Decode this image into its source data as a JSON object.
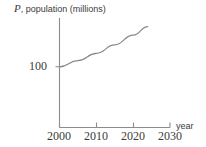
{
  "chart_data": {
    "type": "line",
    "title": "",
    "ylabel_text": "population (millions)",
    "ylabel_variable": "P",
    "ylabel_full": "P, population (millions)",
    "xlabel": "year",
    "x": [
      2000,
      2005,
      2010,
      2015,
      2020,
      2024
    ],
    "values": [
      100,
      110,
      122,
      136,
      152,
      166
    ],
    "series": [
      {
        "name": "population",
        "values": [
          100,
          110,
          122,
          136,
          152,
          166
        ]
      }
    ],
    "xticks": [
      "2000",
      "2010",
      "2020",
      "2030"
    ],
    "xtick_values": [
      2000,
      2010,
      2020,
      2030
    ],
    "yticks": [
      "100"
    ],
    "ytick_values": [
      100
    ],
    "xlim": [
      2000,
      2030
    ],
    "ylim": [
      0,
      190
    ],
    "grid": false,
    "legend": "none",
    "curve_color": "#888888",
    "axis_color": "#8c8c8c",
    "text_color": "#3a3a3a",
    "annotations": []
  },
  "axes": {
    "y_caption_variable": "P",
    "y_caption_rest": ", population (millions)",
    "x_caption": "year",
    "y_tick_0": "100",
    "x_tick_0": "2000",
    "x_tick_1": "2010",
    "x_tick_2": "2020",
    "x_tick_3": "2030"
  }
}
